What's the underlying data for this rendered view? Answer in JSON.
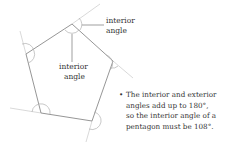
{
  "labels": {
    "top_right": [
      "interior",
      "angle"
    ],
    "center": [
      "interior",
      "angle"
    ]
  },
  "note": {
    "bullet": "•",
    "lines": [
      "The interior and exterior",
      "angles add up to 180°,",
      "so the interior angle of a",
      "pentagon must be 108°."
    ]
  },
  "colors": {
    "polygon_stroke": "#888888",
    "extension_stroke": "#c8c8c8",
    "arc_stroke": "#aaaaaa"
  }
}
